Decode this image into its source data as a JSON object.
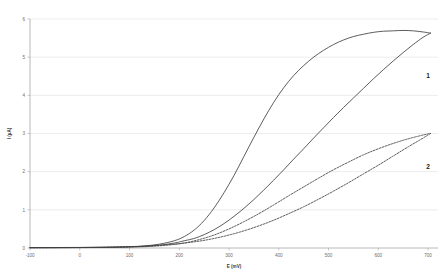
{
  "chart_data": {
    "type": "line",
    "title": "",
    "xlabel": "E (mV)",
    "ylabel": "I (µA)",
    "xlim": [
      -100,
      720
    ],
    "ylim": [
      0,
      6
    ],
    "xticks": [
      -100,
      0,
      100,
      200,
      300,
      400,
      500,
      600,
      700
    ],
    "xticklabels": [
      "-100",
      "0",
      "100",
      "200",
      "300",
      "400",
      "500",
      "600",
      "700"
    ],
    "yticks": [
      0,
      1,
      2,
      3,
      4,
      5,
      6
    ],
    "yticklabels": [
      "0",
      "1",
      "2",
      "3",
      "4",
      "5",
      "6"
    ],
    "grid": "horizontal",
    "legend_position": "inline-annotations",
    "annotations": [
      {
        "text": "1",
        "x": 700,
        "y": 4.45
      },
      {
        "text": "2",
        "x": 700,
        "y": 2.07
      }
    ],
    "series": [
      {
        "name": "1",
        "label": "1",
        "style": "solid",
        "color": "#404040",
        "branch": "forward",
        "x": [
          -100,
          -50,
          0,
          50,
          100,
          130,
          160,
          190,
          210,
          230,
          250,
          270,
          290,
          310,
          330,
          350,
          370,
          390,
          410,
          430,
          450,
          470,
          490,
          510,
          530,
          550,
          570,
          590,
          610,
          630,
          650,
          670,
          690,
          705
        ],
        "y": [
          0.01,
          0.012,
          0.015,
          0.02,
          0.035,
          0.055,
          0.1,
          0.19,
          0.3,
          0.47,
          0.72,
          1.05,
          1.45,
          1.9,
          2.4,
          2.9,
          3.38,
          3.82,
          4.2,
          4.52,
          4.78,
          5.0,
          5.18,
          5.33,
          5.45,
          5.54,
          5.6,
          5.65,
          5.68,
          5.69,
          5.7,
          5.69,
          5.66,
          5.63
        ]
      },
      {
        "name": "1",
        "label": "1",
        "style": "solid",
        "color": "#404040",
        "branch": "reverse",
        "x": [
          705,
          690,
          670,
          650,
          630,
          610,
          590,
          570,
          550,
          530,
          510,
          490,
          470,
          450,
          430,
          410,
          390,
          370,
          350,
          330,
          310,
          290,
          270,
          250,
          230,
          210,
          190,
          160,
          130,
          100,
          50,
          0,
          -50,
          -100
        ],
        "y": [
          5.63,
          5.52,
          5.33,
          5.12,
          4.9,
          4.67,
          4.43,
          4.18,
          3.93,
          3.68,
          3.42,
          3.15,
          2.88,
          2.6,
          2.33,
          2.05,
          1.78,
          1.52,
          1.27,
          1.04,
          0.83,
          0.64,
          0.48,
          0.35,
          0.25,
          0.19,
          0.13,
          0.075,
          0.045,
          0.03,
          0.018,
          0.013,
          0.011,
          0.01
        ]
      },
      {
        "name": "2",
        "label": "2",
        "style": "dashed",
        "color": "#404040",
        "branch": "forward",
        "x": [
          -100,
          -50,
          0,
          50,
          100,
          140,
          180,
          210,
          240,
          270,
          300,
          330,
          360,
          390,
          420,
          450,
          480,
          510,
          540,
          570,
          600,
          630,
          660,
          690,
          705
        ],
        "y": [
          0.008,
          0.009,
          0.011,
          0.015,
          0.025,
          0.04,
          0.08,
          0.13,
          0.22,
          0.34,
          0.5,
          0.69,
          0.9,
          1.13,
          1.37,
          1.6,
          1.83,
          2.05,
          2.25,
          2.44,
          2.6,
          2.74,
          2.86,
          2.96,
          3.0
        ]
      },
      {
        "name": "2",
        "label": "2",
        "style": "dashed",
        "color": "#404040",
        "branch": "reverse",
        "x": [
          705,
          690,
          660,
          630,
          600,
          570,
          540,
          510,
          480,
          450,
          420,
          390,
          360,
          330,
          300,
          270,
          240,
          210,
          180,
          140,
          100,
          50,
          0,
          -50,
          -100
        ],
        "y": [
          3.0,
          2.88,
          2.65,
          2.41,
          2.17,
          1.94,
          1.71,
          1.49,
          1.28,
          1.08,
          0.9,
          0.73,
          0.58,
          0.45,
          0.34,
          0.25,
          0.18,
          0.13,
          0.09,
          0.055,
          0.032,
          0.018,
          0.012,
          0.009,
          0.008
        ]
      }
    ]
  }
}
